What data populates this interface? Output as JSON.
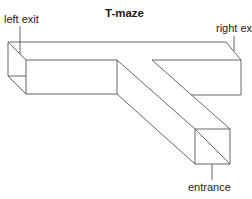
{
  "diagram": {
    "title": "T-maze",
    "labels": {
      "left_exit": "left exit",
      "right_exit": "right exit",
      "entrance": "entrance"
    },
    "line_color": "#555555",
    "text_color": "#1a1a1a"
  }
}
